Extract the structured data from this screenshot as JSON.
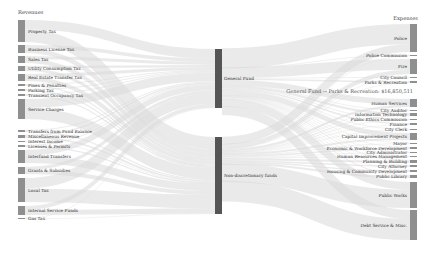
{
  "chart_data": {
    "type": "sankey",
    "title": "",
    "left_header": "Revenues",
    "right_header": "Expenses",
    "revenues": [
      {
        "name": "Property Tax",
        "y": 20,
        "h": 22
      },
      {
        "name": "Business License Tax",
        "y": 45,
        "h": 8
      },
      {
        "name": "Sales Tax",
        "y": 56,
        "h": 7
      },
      {
        "name": "Utility Consumption Tax",
        "y": 66,
        "h": 5
      },
      {
        "name": "Real Estate Transfer Tax",
        "y": 74,
        "h": 7
      },
      {
        "name": "Fines & Penalties",
        "y": 84,
        "h": 2
      },
      {
        "name": "Parking Tax",
        "y": 89,
        "h": 2
      },
      {
        "name": "Transient Occupancy Tax",
        "y": 94,
        "h": 2
      },
      {
        "name": "Service Charges",
        "y": 99,
        "h": 20
      },
      {
        "name": "Transfers from Fund Balance",
        "y": 130,
        "h": 2
      },
      {
        "name": "Miscellaneous Revenue",
        "y": 135,
        "h": 3
      },
      {
        "name": "Interest Income",
        "y": 141,
        "h": 1
      },
      {
        "name": "Licenses & Permits",
        "y": 145,
        "h": 2
      },
      {
        "name": "Interfund Transfers",
        "y": 150,
        "h": 13
      },
      {
        "name": "Grants & Subsidies",
        "y": 167,
        "h": 7
      },
      {
        "name": "Local Tax",
        "y": 178,
        "h": 24
      },
      {
        "name": "Internal Service Funds",
        "y": 206,
        "h": 9
      },
      {
        "name": "Gas Tax",
        "y": 218,
        "h": 1
      }
    ],
    "funds": [
      {
        "name": "General Fund",
        "y": 49,
        "h": 59
      },
      {
        "name": "Non-discretionary funds",
        "y": 137,
        "h": 77
      }
    ],
    "expenses": [
      {
        "name": "Police",
        "y": 24,
        "h": 28
      },
      {
        "name": "Police Commission",
        "y": 55,
        "h": 1
      },
      {
        "name": "Fire",
        "y": 59,
        "h": 15
      },
      {
        "name": "City Council",
        "y": 77,
        "h": 1
      },
      {
        "name": "Parks & Recreation",
        "y": 81,
        "h": 2
      },
      {
        "name": "Human Services",
        "y": 99,
        "h": 8
      },
      {
        "name": "City Auditor",
        "y": 110,
        "h": 1
      },
      {
        "name": "Information Technology",
        "y": 113,
        "h": 3
      },
      {
        "name": "Public Ethics Commission",
        "y": 119,
        "h": 1
      },
      {
        "name": "Finance",
        "y": 123,
        "h": 2
      },
      {
        "name": "City Clerk",
        "y": 129,
        "h": 1
      },
      {
        "name": "Capital Improvement Projects",
        "y": 133,
        "h": 7
      },
      {
        "name": "Mayor",
        "y": 143,
        "h": 1
      },
      {
        "name": "Economic & Workforce Development",
        "y": 147,
        "h": 2
      },
      {
        "name": "City Administrator",
        "y": 152,
        "h": 1
      },
      {
        "name": "Human Resources Management",
        "y": 156,
        "h": 1
      },
      {
        "name": "Planning & Building",
        "y": 160,
        "h": 3
      },
      {
        "name": "City Attorney",
        "y": 165,
        "h": 2
      },
      {
        "name": "Housing & Community Development",
        "y": 170,
        "h": 2
      },
      {
        "name": "Public Library",
        "y": 175,
        "h": 3
      },
      {
        "name": "Public Works",
        "y": 182,
        "h": 26
      },
      {
        "name": "Debt Service & Misc.",
        "y": 210,
        "h": 30
      }
    ]
  },
  "tooltip": {
    "text": "General Fund → Parks & Recreation: $16,850,511"
  }
}
